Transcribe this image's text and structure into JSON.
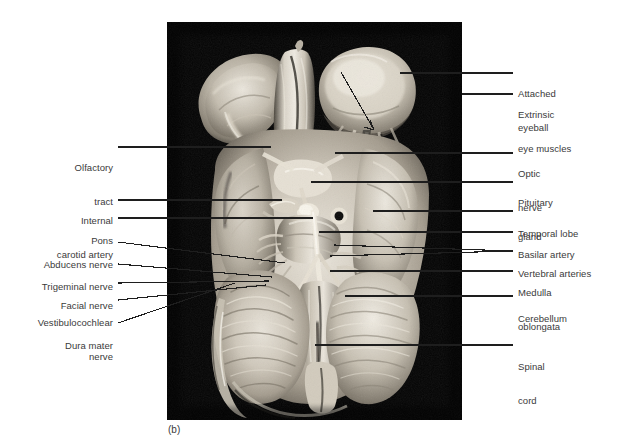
{
  "figure": {
    "caption": "(b)",
    "label_color": "#3a3a3a",
    "leader_color": "#1e1e1e",
    "plate_background": "#000000"
  },
  "labels_right": [
    {
      "id": "attached-eyeball",
      "line1": "Attached",
      "line2": "eyeball"
    },
    {
      "id": "extrinsic-eye-muscles",
      "line1": "Extrinsic",
      "line2": "eye muscles"
    },
    {
      "id": "optic-nerve",
      "line1": "Optic",
      "line2": "nerve"
    },
    {
      "id": "pituitary-gland",
      "line1": "Pituitary",
      "line2": "gland"
    },
    {
      "id": "temporal-lobe",
      "line1": "Temporal lobe",
      "line2": ""
    },
    {
      "id": "basilar-artery",
      "line1": "Basilar artery",
      "line2": ""
    },
    {
      "id": "vertebral-arteries",
      "line1": "Vertebral arteries",
      "line2": ""
    },
    {
      "id": "medulla-oblongata",
      "line1": "Medulla",
      "line2": "oblongata"
    },
    {
      "id": "cerebellum",
      "line1": "Cerebellum",
      "line2": ""
    },
    {
      "id": "spinal-cord",
      "line1": "Spinal",
      "line2": "cord"
    }
  ],
  "labels_left": [
    {
      "id": "olfactory-tract",
      "line1": "Olfactory",
      "line2": "tract"
    },
    {
      "id": "internal-carotid-artery",
      "line1": "Internal",
      "line2": "carotid artery"
    },
    {
      "id": "pons",
      "line1": "Pons",
      "line2": ""
    },
    {
      "id": "abducens-nerve",
      "line1": "Abducens nerve",
      "line2": ""
    },
    {
      "id": "trigeminal-nerve",
      "line1": "Trigeminal nerve",
      "line2": ""
    },
    {
      "id": "facial-nerve",
      "line1": "Facial nerve",
      "line2": ""
    },
    {
      "id": "vestibulocochlear-nerve",
      "line1": "Vestibulocochlear",
      "line2": "nerve"
    },
    {
      "id": "dura-mater",
      "line1": "Dura mater",
      "line2": ""
    }
  ]
}
